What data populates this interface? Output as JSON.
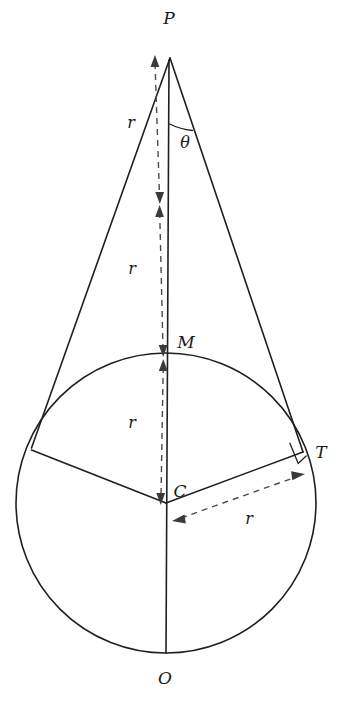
{
  "figure": {
    "background_color": "#ffffff",
    "stroke_color": "#1f1f1f",
    "dash_color": "#4a4a4a",
    "width": 354,
    "height": 717
  },
  "points": {
    "p": {
      "label": "P",
      "x": 170,
      "y": 58,
      "label_x": 169,
      "label_y": 24
    },
    "m": {
      "label": "M",
      "x": 167,
      "y": 357,
      "label_x": 186,
      "label_y": 348
    },
    "c": {
      "label": "C",
      "x": 166,
      "y": 503,
      "label_x": 180,
      "label_y": 497
    },
    "t": {
      "label": "T",
      "x": 303,
      "y": 452,
      "label_x": 321,
      "label_y": 458
    },
    "o": {
      "label": "O",
      "x": 166,
      "y": 653,
      "label_x": 165,
      "label_y": 684
    }
  },
  "measures": {
    "theta": {
      "label": "θ",
      "label_x": 185,
      "label_y": 148
    },
    "r_top": {
      "label": "r",
      "x": 131,
      "y": 128
    },
    "r_middle": {
      "label": "r",
      "x": 132,
      "y": 274
    },
    "r_lower": {
      "label": "r",
      "x": 132,
      "y": 428
    },
    "r_radial": {
      "label": "r",
      "x": 249,
      "y": 524
    }
  },
  "circle": {
    "cx": 166,
    "cy": 503,
    "r": 150
  },
  "elements": {
    "tangent_left": "line from P to left tangent point",
    "tangent_right": "line from P to tangent point T",
    "axis": "vertical line from P through M and C to O",
    "radius_left": "radius from C to left tangent point",
    "radius_right": "radius from C to T",
    "right_angle": "right angle mark at T"
  }
}
